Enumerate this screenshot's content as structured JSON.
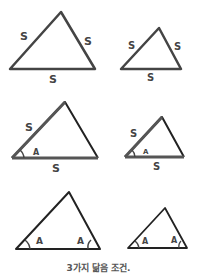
{
  "title": "3가지 닮음 조건.",
  "colors": {
    "stroke": "#333333",
    "label": "#444444",
    "caption": "#555555"
  },
  "rows": [
    {
      "name": "SSS",
      "left": {
        "labels": [
          "S",
          "S",
          "S"
        ]
      },
      "right": {
        "labels": [
          "S",
          "S",
          "S"
        ]
      }
    },
    {
      "name": "SAS",
      "left": {
        "labels": [
          "S",
          "A",
          "S"
        ]
      },
      "right": {
        "labels": [
          "S",
          "A",
          "S"
        ]
      }
    },
    {
      "name": "AA",
      "left": {
        "labels": [
          "A",
          "A"
        ]
      },
      "right": {
        "labels": [
          "A",
          "A"
        ]
      }
    }
  ]
}
